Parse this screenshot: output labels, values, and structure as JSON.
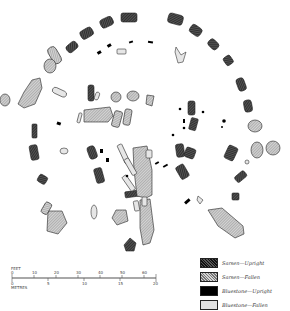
{
  "diagram": {
    "colors": {
      "sarsen_upright": "#3a3a3a",
      "sarsen_fallen": "#9a9a9a",
      "bluestone_upright": "#000000",
      "bluestone_fallen": "#e0e0e0",
      "outline": "#222222"
    }
  },
  "legend": {
    "items": [
      {
        "key": "sarsen_upright",
        "label": "Sarsen—Upright"
      },
      {
        "key": "sarsen_fallen",
        "label": "Sarsen—Fallen"
      },
      {
        "key": "bluestone_upright",
        "label": "Bluestone—Upright"
      },
      {
        "key": "bluestone_fallen",
        "label": "Bluestone—Fallen"
      }
    ]
  },
  "scale": {
    "feet_label": "FEET",
    "metres_label": "METRES",
    "feet_ticks": [
      "0",
      "10",
      "20",
      "30",
      "40",
      "50",
      "60"
    ],
    "metres_ticks": [
      "0",
      "5",
      "10",
      "15",
      "20"
    ]
  }
}
